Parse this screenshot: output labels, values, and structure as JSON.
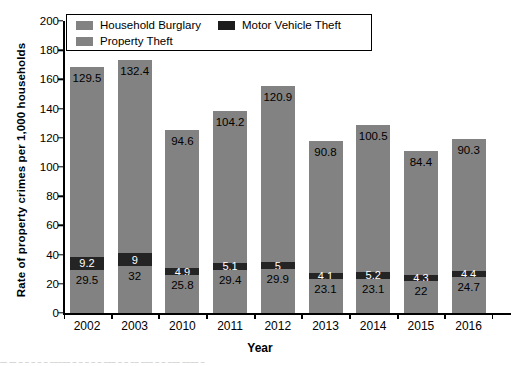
{
  "chart_data": {
    "type": "bar",
    "subtype": "stacked-bar",
    "title": "",
    "xlabel": "Year",
    "ylabel": "Rate of property crimes per 1,000 households",
    "ylim": [
      0,
      200
    ],
    "ytick_step": 20,
    "yticks": [
      "200",
      "180",
      "160",
      "140",
      "120",
      "100",
      "80",
      "60",
      "40",
      "20",
      "0"
    ],
    "grid": false,
    "legend_position": "top-left-inside",
    "categories": [
      "2002",
      "2003",
      "2010",
      "2011",
      "2012",
      "2013",
      "2014",
      "2015",
      "2016"
    ],
    "series": [
      {
        "name": "Household Burglary",
        "color": "#828282",
        "stack_order": 1,
        "values": [
          29.5,
          32,
          25.8,
          29.4,
          29.9,
          23.1,
          23.1,
          22,
          24.7
        ],
        "labels": [
          "29.5",
          "32",
          "25.8",
          "29.4",
          "29.9",
          "23.1",
          "23.1",
          "22",
          "24.7"
        ]
      },
      {
        "name": "Motor Vehicle Theft",
        "color": "#242424",
        "stack_order": 2,
        "values": [
          9.2,
          9,
          4.9,
          5.1,
          5,
          4.1,
          5.2,
          4.3,
          4.4
        ],
        "labels": [
          "9.2",
          "9",
          "4.9",
          "5.1",
          "5",
          "4.1",
          "5.2",
          "4.3",
          "4.4"
        ]
      },
      {
        "name": "Property Theft",
        "color": "#828282",
        "stack_order": 3,
        "values": [
          129.5,
          132.4,
          94.6,
          104.2,
          120.9,
          90.8,
          100.5,
          84.4,
          90.3
        ],
        "labels": [
          "129.5",
          "132.4",
          "94.6",
          "104.2",
          "120.9",
          "90.8",
          "100.5",
          "84.4",
          "90.3"
        ]
      }
    ],
    "totals": [
      168.2,
      173.4,
      125.3,
      138.7,
      155.8,
      118.0,
      128.8,
      110.7,
      119.4
    ]
  },
  "legend": {
    "entries": [
      {
        "label": "Household Burglary",
        "swatch": "gray"
      },
      {
        "label": "Property Theft",
        "swatch": "gray"
      },
      {
        "label": "Motor Vehicle Theft",
        "swatch": "dark"
      }
    ]
  },
  "axes": {
    "x_title": "Year",
    "y_title": "Rate of property crimes per 1,000 households"
  },
  "footer": {
    "cut_off_caption": "—   —    –  –        –  –   – ––––– –  –  –  –   –   –––       –    –  –– –––  – –  –––   ––––    –"
  }
}
